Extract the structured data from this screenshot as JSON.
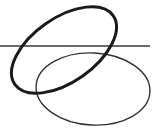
{
  "diagram": {
    "background": "#ffffff",
    "shapes": [
      {
        "id": "horizontal-line",
        "type": "line",
        "x1": 0,
        "y1": 46,
        "x2": 150,
        "y2": 46,
        "stroke": "#3a3a3a",
        "stroke_width": 1.5
      },
      {
        "id": "thick-ellipse",
        "type": "ellipse",
        "cx": 64,
        "cy": 50,
        "rx": 60,
        "ry": 32,
        "rotation": -35,
        "stroke": "#1a1a1a",
        "stroke_width": 3
      },
      {
        "id": "thin-ellipse",
        "type": "ellipse",
        "cx": 93,
        "cy": 89,
        "rx": 57,
        "ry": 36,
        "rotation": 3,
        "stroke": "#333333",
        "stroke_width": 1.4
      }
    ]
  }
}
